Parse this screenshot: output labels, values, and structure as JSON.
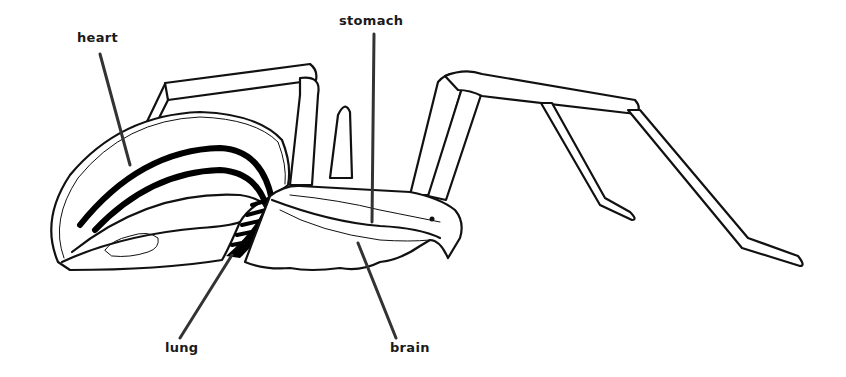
{
  "diagram": {
    "labels": {
      "heart": "heart",
      "stomach": "stomach",
      "lung": "lung",
      "brain": "brain"
    },
    "colors": {
      "background": "#ffffff",
      "ink": "#111111",
      "label_text": "#1a1a1a",
      "leader_line": "#333333"
    }
  }
}
